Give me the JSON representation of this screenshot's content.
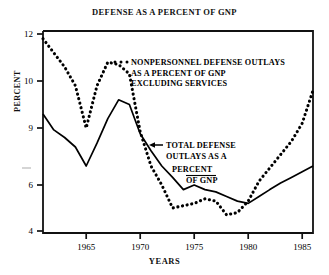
{
  "chart_data": {
    "type": "line",
    "title": "DEFENSE AS A PERCENT OF GNP",
    "xlabel": "YEARS",
    "ylabel": "PERCENT",
    "grid": false,
    "legend_position": "inside-upper-right",
    "xlim": [
      1961,
      1986
    ],
    "ylim": [
      4,
      12
    ],
    "xticks": [
      1965,
      1970,
      1975,
      1980,
      1985
    ],
    "xtick_labels": [
      "1965",
      "1970",
      "1975",
      "1980",
      "1985"
    ],
    "yticks": [
      4,
      6,
      9,
      10,
      12
    ],
    "ytick_labels": [
      "4",
      "6",
      "9",
      "10",
      "12"
    ],
    "y_axis_note": "irregular tick spacing as drawn",
    "series": [
      {
        "name": "NONPERSONNEL DEFENSE OUTLAYS AS A PERCENT OF GNP EXCLUDING SERVICES",
        "style": "dotted",
        "color": "#000000",
        "x": [
          1961,
          1962,
          1963,
          1964,
          1965,
          1966,
          1967,
          1968,
          1969,
          1970,
          1971,
          1972,
          1973,
          1974,
          1975,
          1976,
          1977,
          1978,
          1979,
          1980,
          1981,
          1982,
          1983,
          1984,
          1985,
          1986
        ],
        "values": [
          11.8,
          11.2,
          10.6,
          9.9,
          9.0,
          9.9,
          10.8,
          10.7,
          10.3,
          8.8,
          7.0,
          6.0,
          5.0,
          5.1,
          5.2,
          5.4,
          5.3,
          4.7,
          4.8,
          5.3,
          6.2,
          6.9,
          7.6,
          8.3,
          9.1,
          9.8
        ]
      },
      {
        "name": "TOTAL DEFENSE OUTLAYS AS A PERCENT OF GNP",
        "style": "solid",
        "color": "#000000",
        "x": [
          1961,
          1962,
          1963,
          1964,
          1965,
          1966,
          1967,
          1968,
          1969,
          1970,
          1971,
          1972,
          1973,
          1974,
          1975,
          1976,
          1977,
          1978,
          1979,
          1980,
          1981,
          1982,
          1983,
          1984,
          1985,
          1986
        ],
        "values": [
          9.3,
          8.9,
          8.5,
          8.0,
          7.0,
          8.2,
          9.2,
          9.6,
          9.5,
          8.7,
          7.8,
          7.0,
          6.4,
          5.8,
          6.0,
          5.8,
          5.7,
          5.5,
          5.3,
          5.2,
          5.5,
          5.8,
          6.1,
          6.4,
          6.7,
          7.0
        ]
      }
    ],
    "annotations": [
      {
        "name": "nonpersonnel-legend",
        "marker": "dotted-swatch",
        "lines": [
          "NONPERSONNEL DEFENSE OUTLAYS",
          "AS A PERCENT OF GNP",
          "EXCLUDING SERVICES"
        ]
      },
      {
        "name": "total-defense-callout",
        "marker": "left-arrow",
        "lines": [
          "TOTAL DEFENSE",
          "OUTLAYS AS A",
          "PERCENT",
          "OF GNP"
        ]
      }
    ]
  }
}
